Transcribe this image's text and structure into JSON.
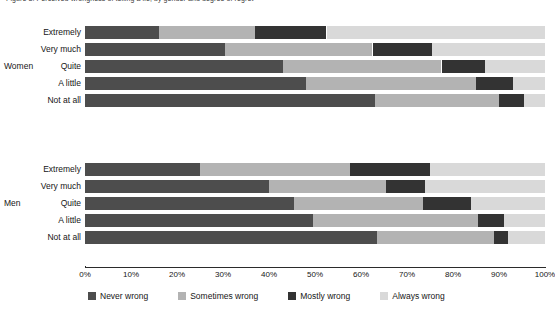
{
  "chart": {
    "title": "Figure 3. Perceived wrongness of telling a lie, by gender and degree of regret",
    "xlabel": "",
    "ylabel": ""
  },
  "axis": {
    "ticks": [
      "0%",
      "10%",
      "20%",
      "30%",
      "40%",
      "50%",
      "60%",
      "70%",
      "80%",
      "90%",
      "100%"
    ]
  },
  "legend": {
    "items": [
      {
        "label": "Never wrong",
        "color": "#4d4d4d",
        "icon": "legend-swatch-never-wrong"
      },
      {
        "label": "Sometimes wrong",
        "color": "#b3b3b3",
        "icon": "legend-swatch-sometimes-wrong"
      },
      {
        "label": "Mostly wrong",
        "color": "#333333",
        "icon": "legend-swatch-mostly-wrong"
      },
      {
        "label": "Always wrong",
        "color": "#d9d9d9",
        "icon": "legend-swatch-always-wrong"
      }
    ]
  },
  "groups": [
    {
      "name": "Women"
    },
    {
      "name": "Men"
    }
  ],
  "chart_data": {
    "type": "bar",
    "orientation": "horizontal",
    "stacked": true,
    "stack_total": 100,
    "title": "Figure 3. Perceived wrongness of telling a lie, by gender and degree of regret",
    "xlabel": "",
    "ylabel": "",
    "xlim": [
      0,
      100
    ],
    "xticks": [
      0,
      10,
      20,
      30,
      40,
      50,
      60,
      70,
      80,
      90,
      100
    ],
    "xtick_labels": [
      "0%",
      "10%",
      "20%",
      "30%",
      "40%",
      "50%",
      "60%",
      "70%",
      "80%",
      "90%",
      "100%"
    ],
    "grid": false,
    "legend_position": "bottom",
    "series": [
      {
        "name": "Never wrong",
        "color": "#4d4d4d"
      },
      {
        "name": "Sometimes wrong",
        "color": "#b3b3b3"
      },
      {
        "name": "Mostly wrong",
        "color": "#333333"
      },
      {
        "name": "Always wrong",
        "color": "#d9d9d9"
      }
    ],
    "categories": [
      "Extremely",
      "Very much",
      "Quite",
      "A little",
      "Not at all"
    ],
    "groups": [
      {
        "group": "Women",
        "rows": [
          {
            "category": "Extremely",
            "values": [
              16.0,
              21.0,
              15.5,
              47.5
            ]
          },
          {
            "category": "Very much",
            "values": [
              30.5,
              32.0,
              13.0,
              24.5
            ]
          },
          {
            "category": "Quite",
            "values": [
              43.0,
              34.5,
              9.5,
              13.0
            ]
          },
          {
            "category": "A little",
            "values": [
              48.0,
              37.0,
              8.0,
              7.0
            ]
          },
          {
            "category": "Not at all",
            "values": [
              63.0,
              27.0,
              5.5,
              4.5
            ]
          }
        ]
      },
      {
        "group": "Men",
        "rows": [
          {
            "category": "Extremely",
            "values": [
              25.0,
              32.5,
              17.5,
              25.0
            ]
          },
          {
            "category": "Very much",
            "values": [
              40.0,
              25.5,
              8.5,
              26.0
            ]
          },
          {
            "category": "Quite",
            "values": [
              45.5,
              28.0,
              10.5,
              16.0
            ]
          },
          {
            "category": "A little",
            "values": [
              49.5,
              36.0,
              5.5,
              9.0
            ]
          },
          {
            "category": "Not at all",
            "values": [
              63.5,
              25.5,
              3.0,
              8.0
            ]
          }
        ]
      }
    ]
  }
}
